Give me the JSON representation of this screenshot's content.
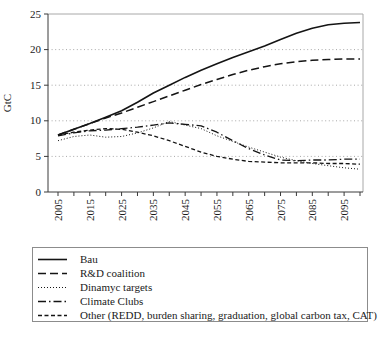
{
  "theme": {
    "background": "#ffffff",
    "axis_color": "#3a3a3a",
    "grid_color": "#a8a8a8",
    "border_color": "#a8a8a8",
    "line_color": "#141414",
    "text_color": "#1a1a1a",
    "legend_border": "#8c8c8c"
  },
  "chart_data": {
    "type": "line",
    "title": "",
    "xlabel": "",
    "ylabel": "GtC",
    "ylim": [
      0,
      25
    ],
    "yticks": [
      0,
      5,
      10,
      15,
      20,
      25
    ],
    "xlim": [
      2005,
      2100
    ],
    "xtick_step": 5,
    "xtick_labels": [
      "2005",
      "2015",
      "2025",
      "2035",
      "2045",
      "2055",
      "2065",
      "2075",
      "2085",
      "2095"
    ],
    "grid": "horizontal-dotted",
    "legend_position": "bottom-box",
    "x": [
      2005,
      2010,
      2015,
      2020,
      2025,
      2030,
      2035,
      2040,
      2045,
      2050,
      2055,
      2060,
      2065,
      2070,
      2075,
      2080,
      2085,
      2090,
      2095,
      2100
    ],
    "series": [
      {
        "id": "bau",
        "name": "Bau",
        "style": "solid",
        "dash": "",
        "width": 1.6,
        "values": [
          8.0,
          8.8,
          9.6,
          10.5,
          11.4,
          12.6,
          13.9,
          15.0,
          16.1,
          17.1,
          18.0,
          18.9,
          19.7,
          20.5,
          21.4,
          22.3,
          23.0,
          23.5,
          23.7,
          23.8
        ]
      },
      {
        "id": "rd-coalition",
        "name": "R&D coalition",
        "style": "dashed",
        "dash": "8,4",
        "width": 1.5,
        "values": [
          8.0,
          8.8,
          9.6,
          10.4,
          11.1,
          11.9,
          12.7,
          13.5,
          14.3,
          15.1,
          15.8,
          16.5,
          17.1,
          17.6,
          18.0,
          18.3,
          18.5,
          18.6,
          18.7,
          18.7
        ]
      },
      {
        "id": "dinamyc-targets",
        "name": "Dinamyc targets",
        "style": "dotted",
        "dash": "1,2",
        "width": 1,
        "values": [
          7.2,
          7.8,
          8.0,
          7.7,
          7.8,
          8.3,
          9.0,
          9.9,
          9.4,
          8.9,
          7.9,
          7.1,
          6.3,
          5.6,
          4.9,
          4.4,
          4.0,
          3.7,
          3.4,
          3.2
        ]
      },
      {
        "id": "climate-clubs",
        "name": "Climate Clubs",
        "style": "dash-dot",
        "dash": "8,3,1.5,3",
        "width": 1.3,
        "values": [
          7.9,
          8.3,
          8.6,
          8.7,
          8.9,
          9.1,
          9.4,
          9.7,
          9.5,
          9.3,
          8.4,
          7.2,
          6.1,
          5.2,
          4.5,
          4.4,
          4.5,
          4.5,
          4.6,
          4.6
        ]
      },
      {
        "id": "other",
        "name": "Other (REDD, burden sharing, graduation, global carbon tax, CAT)",
        "style": "short-dash",
        "dash": "4,2.5",
        "width": 1.3,
        "values": [
          8.0,
          8.4,
          8.7,
          8.9,
          8.8,
          8.4,
          7.9,
          7.2,
          6.4,
          5.6,
          5.0,
          4.6,
          4.3,
          4.2,
          4.1,
          4.1,
          4.1,
          4.0,
          4.0,
          3.9
        ]
      }
    ]
  }
}
